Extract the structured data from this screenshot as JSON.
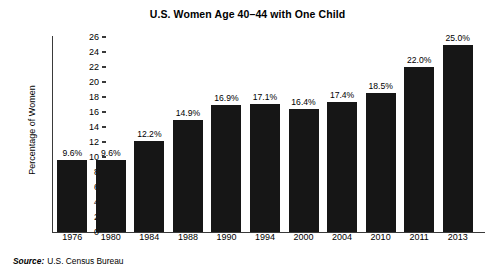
{
  "chart_data": {
    "type": "bar",
    "title": "U.S. Women Age 40–44 with One Child",
    "xlabel": "",
    "ylabel": "Percentage of Women",
    "ylim": [
      0,
      26
    ],
    "ytick_step": 2,
    "yticks": [
      26,
      24,
      22,
      20,
      18,
      16,
      14,
      12,
      10,
      8,
      6,
      4,
      2,
      0
    ],
    "grid": false,
    "legend": false,
    "value_label_suffix": "%",
    "categories": [
      "1976",
      "1980",
      "1984",
      "1988",
      "1990",
      "1994",
      "2000",
      "2004",
      "2010",
      "2011",
      "2013"
    ],
    "values": [
      9.6,
      9.6,
      12.2,
      14.9,
      16.9,
      17.1,
      16.4,
      17.4,
      18.5,
      22.0,
      25.0
    ],
    "value_labels": [
      "9.6%",
      "9.6%",
      "12.2%",
      "14.9%",
      "16.9%",
      "17.1%",
      "16.4%",
      "17.4%",
      "18.5%",
      "22.0%",
      "25.0%"
    ],
    "bar_color": "#161616",
    "axis_color": "#3a3a3a",
    "background_color": "#ffffff"
  },
  "source": {
    "label": "Source:",
    "text": "U.S. Census Bureau"
  }
}
